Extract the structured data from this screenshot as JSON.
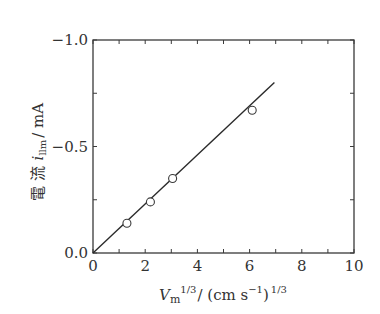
{
  "chart_data": {
    "type": "scatter",
    "title": "",
    "xlabel": "V_m^{1/3} / (cm s^-1)^{1/3}",
    "ylabel": "電 流 i_llm / mA",
    "xlim": [
      0,
      10
    ],
    "ylim": [
      0,
      -1.0
    ],
    "x_ticks": [
      0,
      2,
      4,
      6,
      8,
      10
    ],
    "x_tick_labels": [
      "0",
      "2",
      "4",
      "6",
      "8",
      "10"
    ],
    "x_minor_tick_step": 1,
    "y_ticks": [
      0.0,
      -0.5,
      -1.0
    ],
    "y_tick_labels": [
      "0.0",
      "−0.5",
      "−1.0"
    ],
    "y_minor_tick_step": 0.25,
    "grid": false,
    "ticks_inward_all_sides": true,
    "series": [
      {
        "name": "measured",
        "marker": "open-circle",
        "x": [
          1.3,
          2.2,
          3.05,
          6.1
        ],
        "y": [
          -0.14,
          -0.24,
          -0.35,
          -0.67
        ]
      },
      {
        "name": "fit",
        "style": "line",
        "x": [
          0,
          6.95
        ],
        "y": [
          0,
          -0.8
        ]
      }
    ]
  },
  "labels": {
    "ylabel_kanji": "電 流",
    "ylabel_var": "i",
    "ylabel_sub": "llm",
    "ylabel_unit": "/ mA",
    "xlabel_var": "V",
    "xlabel_sub": "m",
    "xlabel_sup": "1/3",
    "xlabel_unit_pre": "/ (cm s",
    "xlabel_unit_sup": "−1",
    "xlabel_unit_post": ")",
    "xlabel_unit_sup2": "1/3"
  },
  "colors": {
    "axis": "#3a3a3a",
    "line": "#2a2a2a",
    "marker_stroke": "#3a3a3a",
    "marker_fill": "#ffffff"
  }
}
